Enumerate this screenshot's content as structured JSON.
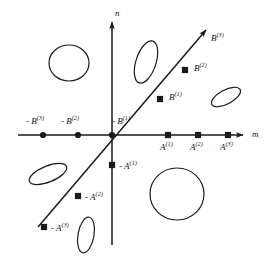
{
  "figure": {
    "kind": "number-line-lattice-diagram",
    "background": "#ffffff",
    "stroke": "#1a1a1a",
    "width": 270,
    "height": 258
  },
  "axes": {
    "horizontal": {
      "name": "m",
      "label": "m",
      "y": 135,
      "x_start": 18,
      "x_end": 243,
      "arrow": "right"
    },
    "vertical": {
      "name": "n",
      "label": "n",
      "x": 112,
      "y_start": 245,
      "y_end": 22,
      "arrow": "up"
    },
    "origin": {
      "x": 112,
      "y": 135
    }
  },
  "diagonal": {
    "label": "diagonal-line",
    "x1": 38,
    "y1": 227,
    "x2": 206,
    "y2": 30,
    "arrow": "up-right"
  },
  "points": [
    {
      "id": "neg-b3",
      "label": "- B",
      "sup": "(3)",
      "marker": "dot",
      "x": 43,
      "y": 135,
      "lx": 26,
      "ly": 117
    },
    {
      "id": "neg-b2",
      "label": "- B",
      "sup": "(2)",
      "marker": "dot",
      "x": 78,
      "y": 135,
      "lx": 61,
      "ly": 117
    },
    {
      "id": "neg-b1",
      "label": "- B",
      "sup": "(1)",
      "marker": "dot",
      "x": 112,
      "y": 135,
      "lx": 112,
      "ly": 117
    },
    {
      "id": "a1",
      "label": "A",
      "sup": "(1)",
      "marker": "square",
      "x": 168,
      "y": 135,
      "lx": 160,
      "ly": 143
    },
    {
      "id": "a2",
      "label": "A",
      "sup": "(2)",
      "marker": "square",
      "x": 198,
      "y": 135,
      "lx": 190,
      "ly": 143
    },
    {
      "id": "a3",
      "label": "A",
      "sup": "(3)",
      "marker": "square",
      "x": 228,
      "y": 135,
      "lx": 220,
      "ly": 143
    },
    {
      "id": "b1",
      "label": "B",
      "sup": "(1)",
      "marker": "square",
      "x": 160,
      "y": 99,
      "lx": 169,
      "ly": 93
    },
    {
      "id": "b2",
      "label": "B",
      "sup": "(2)",
      "marker": "square",
      "x": 185,
      "y": 70,
      "lx": 194,
      "ly": 64
    },
    {
      "id": "b3",
      "label": "B",
      "sup": "(3)",
      "marker": "none",
      "x": 206,
      "y": 30,
      "lx": 211,
      "ly": 34
    },
    {
      "id": "neg-a1",
      "label": "- A",
      "sup": "(1)",
      "marker": "square",
      "x": 112,
      "y": 165,
      "lx": 119,
      "ly": 162
    },
    {
      "id": "neg-a2",
      "label": "- A",
      "sup": "(2)",
      "marker": "square",
      "x": 78,
      "y": 196,
      "lx": 85,
      "ly": 193
    },
    {
      "id": "neg-a3",
      "label": "- A",
      "sup": "(3)",
      "marker": "square",
      "x": 44,
      "y": 227,
      "lx": 51,
      "ly": 224
    }
  ],
  "ovals": [
    {
      "id": "oval-upper-left-circle",
      "cx": 69,
      "cy": 63,
      "rx": 20,
      "ry": 18,
      "rot": 0
    },
    {
      "id": "oval-upper-mid",
      "cx": 146,
      "cy": 62,
      "rx": 10,
      "ry": 22,
      "rot": 18
    },
    {
      "id": "oval-right",
      "cx": 226,
      "cy": 97,
      "rx": 16,
      "ry": 7,
      "rot": -28
    },
    {
      "id": "oval-lower-left",
      "cx": 48,
      "cy": 174,
      "rx": 20,
      "ry": 8,
      "rot": -22
    },
    {
      "id": "oval-lower-right-circle",
      "cx": 177,
      "cy": 194,
      "rx": 27,
      "ry": 26,
      "rot": 0
    },
    {
      "id": "oval-bottom",
      "cx": 86,
      "cy": 235,
      "rx": 8,
      "ry": 18,
      "rot": 10
    }
  ]
}
